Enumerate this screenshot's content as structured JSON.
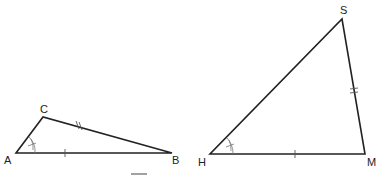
{
  "diagram": {
    "triangles": [
      {
        "name": "ABC",
        "vertices": {
          "A": {
            "label": "A",
            "x": 16,
            "y": 153
          },
          "B": {
            "label": "B",
            "x": 172,
            "y": 153
          },
          "C": {
            "label": "C",
            "x": 43,
            "y": 117
          }
        },
        "markings": {
          "AB": "single tick",
          "CB": "double tick",
          "angle_A": "double arc with tick"
        }
      },
      {
        "name": "HMS",
        "vertices": {
          "H": {
            "label": "H",
            "x": 210,
            "y": 154
          },
          "M": {
            "label": "M",
            "x": 365,
            "y": 154
          },
          "S": {
            "label": "S",
            "x": 342,
            "y": 19
          }
        },
        "markings": {
          "HM": "single tick",
          "SM": "double tick",
          "angle_H": "double arc with tick"
        }
      }
    ],
    "labels": {
      "A": "A",
      "B": "B",
      "C": "C",
      "H": "H",
      "M": "M",
      "S": "S"
    },
    "stroke_color": "#222222"
  }
}
